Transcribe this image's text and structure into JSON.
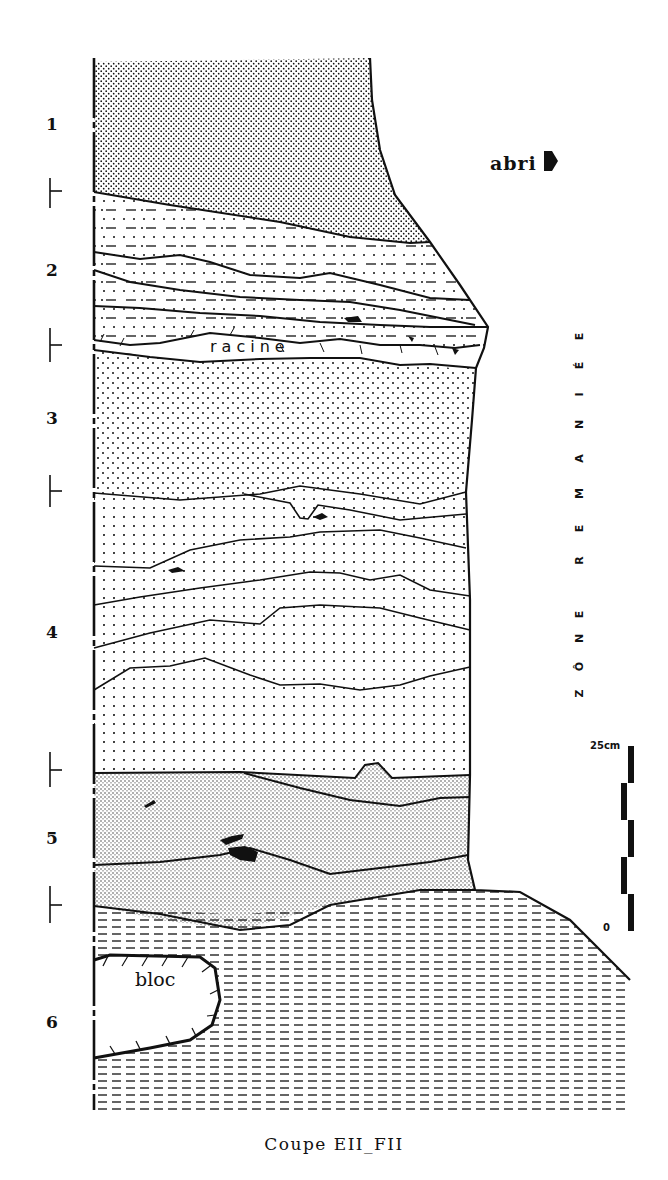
{
  "figure": {
    "caption": "Coupe EII_FII",
    "orientation_label": "abri",
    "side_zone_label": "ZÔNE REMANIÉE",
    "side_zone_letters": [
      "Z",
      "Ô",
      "N",
      "E",
      " ",
      "R",
      "E",
      "M",
      "A",
      "N",
      "I",
      "É",
      "E"
    ],
    "root_label": "racine",
    "block_label": "bloc",
    "scale": {
      "top_label": "25cm",
      "bottom_label": "0",
      "segments": 5
    },
    "layers": [
      {
        "number": "1",
        "pattern": "dense-stipple"
      },
      {
        "number": "2",
        "pattern": "dots-and-dashes"
      },
      {
        "number": "3",
        "pattern": "sparse-dots"
      },
      {
        "number": "4",
        "pattern": "sparse-dots-with-lenses"
      },
      {
        "number": "5",
        "pattern": "dense-stipple-grey"
      },
      {
        "number": "6",
        "pattern": "horizontal-dashes"
      }
    ],
    "colors": {
      "ink": "#111111",
      "paper": "#ffffff"
    }
  }
}
